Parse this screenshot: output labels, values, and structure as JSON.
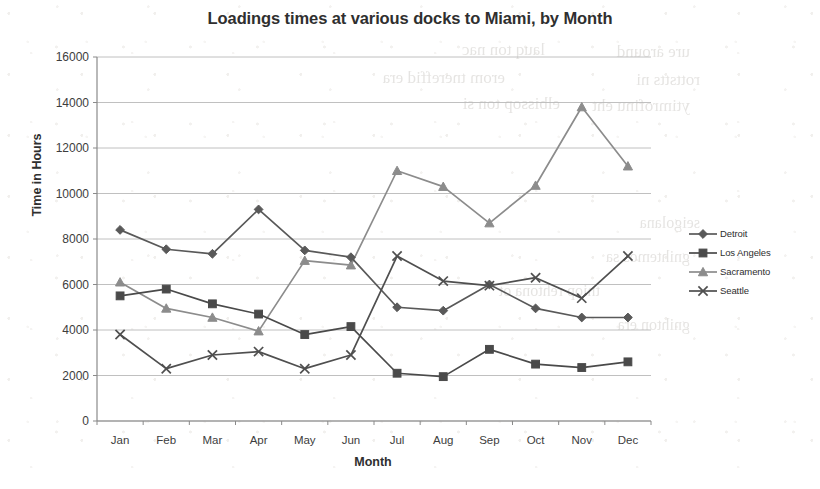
{
  "chart_data": {
    "type": "line",
    "title": "Loadings times at various docks to Miami, by Month",
    "xlabel": "Month",
    "ylabel": "Time in Hours",
    "categories": [
      "Jan",
      "Feb",
      "Mar",
      "Apr",
      "May",
      "Jun",
      "Jul",
      "Aug",
      "Sep",
      "Oct",
      "Nov",
      "Dec"
    ],
    "ylim": [
      0,
      16000
    ],
    "ytick_step": 2000,
    "yticks": [
      "0",
      "2000",
      "4000",
      "6000",
      "8000",
      "10000",
      "12000",
      "14000",
      "16000"
    ],
    "grid": "horizontal",
    "legend_position": "right",
    "series": [
      {
        "name": "Detroit",
        "marker": "diamond",
        "color": "#595959",
        "values": [
          8400,
          7550,
          7350,
          9300,
          7500,
          7200,
          5000,
          4850,
          6000,
          4950,
          4550,
          4550
        ]
      },
      {
        "name": "Los Angeles",
        "marker": "square",
        "color": "#4a4a4a",
        "values": [
          5500,
          5800,
          5150,
          4700,
          3800,
          4150,
          2100,
          1950,
          3150,
          2500,
          2350,
          2600
        ]
      },
      {
        "name": "Sacramento",
        "marker": "triangle",
        "color": "#8c8c8c",
        "values": [
          6100,
          4950,
          4550,
          3950,
          7050,
          6850,
          11000,
          10300,
          8700,
          10350,
          13800,
          11200
        ]
      },
      {
        "name": "Seattle",
        "marker": "cross",
        "color": "#4f4f4f",
        "values": [
          3800,
          2300,
          2900,
          3050,
          2300,
          2900,
          7250,
          6150,
          5950,
          6300,
          5400,
          7250
        ]
      }
    ]
  },
  "bleed_text": {
    "lines": [
      {
        "text": "ure around",
        "x": 690,
        "y": 42,
        "size": 17
      },
      {
        "text": "lauq ton nac",
        "x": 545,
        "y": 40,
        "size": 17
      },
      {
        "text": "rottstts ni",
        "x": 700,
        "y": 70,
        "size": 17
      },
      {
        "text": "erom tnereffid era",
        "x": 505,
        "y": 68,
        "size": 17
      },
      {
        "text": "ytimrofinu eht",
        "x": 690,
        "y": 96,
        "size": 17
      },
      {
        "text": "elbissop ton si",
        "x": 560,
        "y": 94,
        "size": 17
      },
      {
        "text": "seigolana",
        "x": 700,
        "y": 214,
        "size": 16
      },
      {
        "text": "gnihtemos sa",
        "x": 690,
        "y": 248,
        "size": 16
      },
      {
        "text": "tniop rehtona ot",
        "x": 600,
        "y": 282,
        "size": 16
      },
      {
        "text": "gnihton era",
        "x": 690,
        "y": 316,
        "size": 16
      }
    ]
  },
  "plot_area": {
    "left": 97,
    "right": 651,
    "top": 57,
    "bottom": 421
  }
}
